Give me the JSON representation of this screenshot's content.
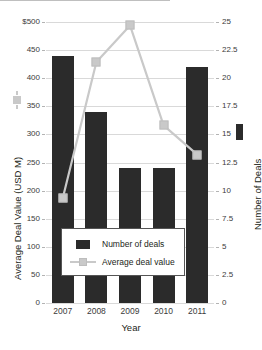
{
  "chart_data": {
    "type": "bar",
    "title": "",
    "xlabel": "Year",
    "ylabel": "Average Deal Value (USD M)",
    "y2label": "Number of Deals",
    "categories": [
      "2007",
      "2008",
      "2009",
      "2010",
      "2011"
    ],
    "grid": true,
    "legend_position": "inside-bottom-center",
    "ylim": [
      0,
      500
    ],
    "y2lim": [
      0,
      25
    ],
    "yticks": [
      "0",
      "50",
      "100",
      "150",
      "200",
      "250",
      "300",
      "350",
      "400",
      "450",
      "$500"
    ],
    "y2ticks": [
      "0",
      "2.5",
      "5",
      "7.5",
      "10",
      "12.5",
      "15",
      "17.5",
      "20",
      "22.5",
      "25"
    ],
    "ytick_values": [
      0,
      50,
      100,
      150,
      200,
      250,
      300,
      350,
      400,
      450,
      500
    ],
    "y2tick_values": [
      0,
      2.5,
      5,
      7.5,
      10,
      12.5,
      15,
      17.5,
      20,
      22.5,
      25
    ],
    "series": [
      {
        "name": "Number of deals",
        "kind": "bar",
        "axis": "right",
        "color": "#2b2b2b",
        "values": [
          22,
          17,
          12,
          12,
          21
        ]
      },
      {
        "name": "Average deal value",
        "kind": "line",
        "axis": "left",
        "color": "#c9c9c9",
        "values": [
          187,
          429,
          494,
          316,
          264
        ]
      }
    ]
  },
  "legend": {
    "items": [
      {
        "label": "Number of deals",
        "key": "bar-swatch"
      },
      {
        "label": "Average deal value",
        "key": "line-marker-swatch"
      }
    ]
  },
  "axes": {
    "x_title": "Year",
    "y_left_title": "Average Deal Value (USD M)",
    "y_right_title": "Number of Deals"
  }
}
